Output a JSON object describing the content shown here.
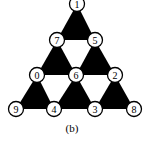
{
  "diagram": {
    "caption": "(b)",
    "colors": {
      "triangle_fill": "#000000",
      "node_fill": "#ffffff",
      "node_stroke": "#000000",
      "background": "#ffffff"
    },
    "nodes": [
      {
        "id": "1",
        "label": "1",
        "x": 77,
        "y": 4
      },
      {
        "id": "7",
        "label": "7",
        "x": 57,
        "y": 40
      },
      {
        "id": "5",
        "label": "5",
        "x": 95,
        "y": 40
      },
      {
        "id": "0",
        "label": "0",
        "x": 37,
        "y": 75
      },
      {
        "id": "6",
        "label": "6",
        "x": 76,
        "y": 75
      },
      {
        "id": "2",
        "label": "2",
        "x": 115,
        "y": 75
      },
      {
        "id": "9",
        "label": "9",
        "x": 16,
        "y": 109
      },
      {
        "id": "4",
        "label": "4",
        "x": 54,
        "y": 109
      },
      {
        "id": "3",
        "label": "3",
        "x": 95,
        "y": 109
      },
      {
        "id": "8",
        "label": "8",
        "x": 134,
        "y": 109
      }
    ],
    "filled_triangles": [
      [
        "1",
        "7",
        "5"
      ],
      [
        "7",
        "0",
        "6"
      ],
      [
        "5",
        "6",
        "2"
      ],
      [
        "0",
        "9",
        "4"
      ],
      [
        "6",
        "4",
        "3"
      ],
      [
        "2",
        "3",
        "8"
      ]
    ]
  }
}
